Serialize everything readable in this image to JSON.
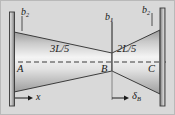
{
  "figure": {
    "background_color": "#d9d9d9",
    "line_color": "#1a1a1a",
    "beam_fill_light": "#f2f2f2",
    "beam_fill_dark": "#8c8c8c",
    "support_color": "#9a9a9a"
  },
  "labels": {
    "b_left": "b",
    "b_left_sub": "2",
    "b_mid": "b",
    "b_mid_sub": "1",
    "b_right": "b",
    "b_right_sub": "2",
    "length_left": "3L/5",
    "length_right": "2L/5",
    "point_a": "A",
    "point_b": "B",
    "point_c": "C",
    "axis_x": "x",
    "deflection": "δ",
    "deflection_sub": "B"
  },
  "geometry": {
    "left_support_x": 14,
    "right_support_x": 160,
    "waist_x": 112,
    "centerline_y": 62,
    "half_height_end": 30,
    "half_height_waist": 9
  }
}
